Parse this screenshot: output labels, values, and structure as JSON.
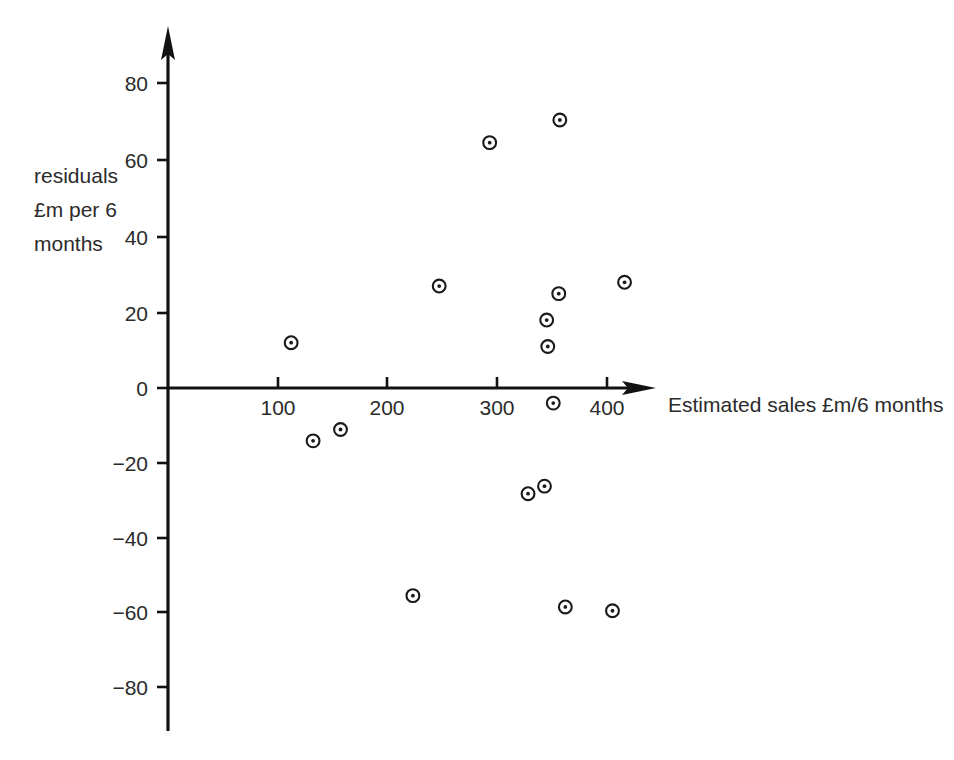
{
  "chart_data": {
    "type": "scatter",
    "title": "",
    "xlabel": "Estimated sales £m/6 months",
    "ylabel_lines": [
      "residuals",
      "£m per 6",
      "months"
    ],
    "ylabel": "residuals £m per 6 months",
    "grid": false,
    "legend": null,
    "xlim": [
      0,
      440
    ],
    "ylim": [
      -92,
      92
    ],
    "xticks": [
      100,
      200,
      300,
      400
    ],
    "xtick_labels": [
      "100",
      "200",
      "300",
      "400"
    ],
    "yticks": [
      -80,
      -60,
      -40,
      -20,
      0,
      20,
      40,
      60,
      80
    ],
    "ytick_labels": [
      "−80",
      "−60",
      "−40",
      "−20",
      "0",
      "20",
      "40",
      "60",
      "80"
    ],
    "marker": "circle-with-center-dot",
    "points": [
      {
        "x": 112,
        "y": 12
      },
      {
        "x": 132,
        "y": -14
      },
      {
        "x": 157,
        "y": -11
      },
      {
        "x": 223,
        "y": -55
      },
      {
        "x": 247,
        "y": 27
      },
      {
        "x": 293,
        "y": 65
      },
      {
        "x": 328,
        "y": -28
      },
      {
        "x": 343,
        "y": -26
      },
      {
        "x": 345,
        "y": 18
      },
      {
        "x": 346,
        "y": 11
      },
      {
        "x": 351,
        "y": -4
      },
      {
        "x": 356,
        "y": 25
      },
      {
        "x": 357,
        "y": 71
      },
      {
        "x": 362,
        "y": -58
      },
      {
        "x": 405,
        "y": -59
      },
      {
        "x": 416,
        "y": 28
      }
    ]
  },
  "axes": {
    "x_axis_name": "x-axis",
    "y_axis_name": "y-axis",
    "arrow_style": "filled-triangle"
  }
}
